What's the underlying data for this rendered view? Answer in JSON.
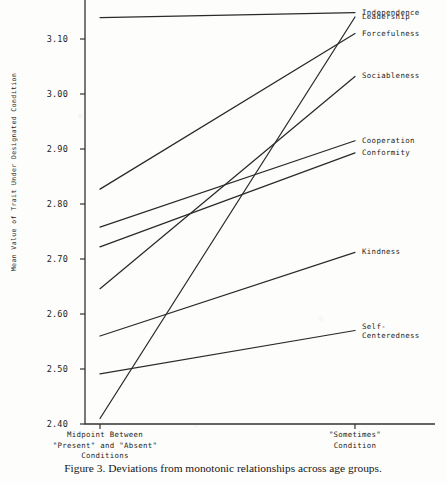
{
  "caption": "Figure 3. Deviations from monotonic relationships across age groups.",
  "chart_data": {
    "type": "line",
    "title": "",
    "xlabel": "",
    "ylabel": "Mean Value of Trait Under Designated Condition",
    "ylim": [
      2.4,
      3.16
    ],
    "yticks": [
      3.1,
      3.0,
      2.9,
      2.8,
      2.7,
      2.6,
      2.5,
      2.4
    ],
    "ytick_labels": [
      "3.10",
      "3.00",
      "2.90",
      "2.80",
      "2.70",
      "2.60",
      "2.50",
      "2.40"
    ],
    "grid": false,
    "legend_position": "right-of-lines",
    "categories": [
      "Midpoint Between \"Present\" and \"Absent\" Conditions",
      "\"Sometimes\" Condition"
    ],
    "x": [
      0,
      1
    ],
    "xtick_labels": [
      "Midpoint Between\n\"Present\" and \"Absent\"\nConditions",
      "\"Sometimes\"\nCondition"
    ],
    "series": [
      {
        "name": "Independence",
        "values": [
          3.139,
          3.148
        ],
        "label": "Independence"
      },
      {
        "name": "Leadership",
        "values": [
          2.41,
          3.14
        ],
        "label": "Leadership"
      },
      {
        "name": "Forcefulness",
        "values": [
          2.827,
          3.11
        ],
        "label": "Forcefulness"
      },
      {
        "name": "Sociableness",
        "values": [
          2.646,
          3.032
        ],
        "label": "Sociableness"
      },
      {
        "name": "Cooperation",
        "values": [
          2.758,
          2.915
        ],
        "label": "Cooperation"
      },
      {
        "name": "Conformity",
        "values": [
          2.722,
          2.893
        ],
        "label": "Conformity"
      },
      {
        "name": "Kindness",
        "values": [
          2.56,
          2.712
        ],
        "label": "Kindness"
      },
      {
        "name": "Self-Centeredness",
        "values": [
          2.491,
          2.57
        ],
        "label": "Self-\nCenteredness"
      }
    ],
    "line_color": "#2a2a2a"
  }
}
